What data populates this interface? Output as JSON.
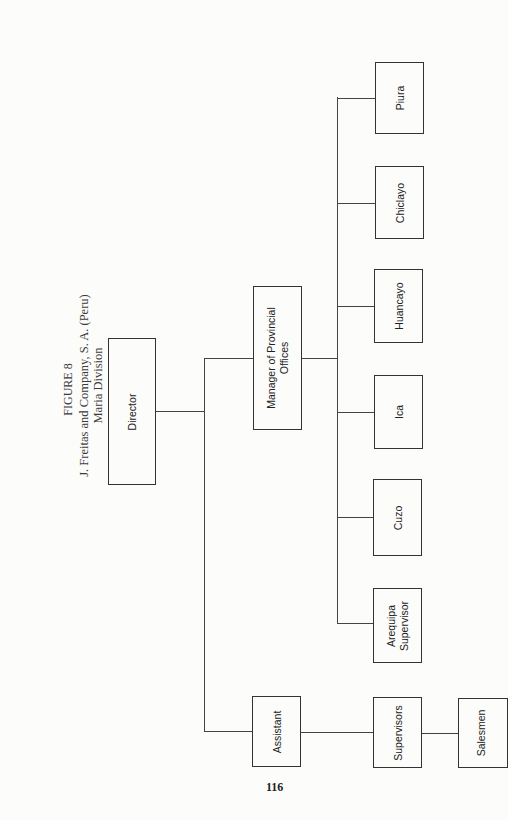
{
  "figure": {
    "label": "FIGURE 8",
    "title": "J. Freitas and Company, S. A. (Peru)",
    "subtitle": "Maria Division"
  },
  "org_chart": {
    "root": "Director",
    "nodes": {
      "director": "Director",
      "manager_provincial": "Manager of Provincial Offices",
      "manager_line1": "Manager of Provincial",
      "manager_line2": "Offices",
      "piura": "Piura",
      "chiclayo": "Chiclayo",
      "huancayo": "Huancayo",
      "ica": "Ica",
      "cuzo": "Cuzo",
      "arequipa_line1": "Arequipa",
      "arequipa_line2": "Supervisor",
      "assistant": "Assistant",
      "supervisors": "Supervisors",
      "salesmen": "Salesmen"
    },
    "hierarchy": [
      {
        "name": "Director",
        "children": [
          {
            "name": "Manager of Provincial Offices",
            "children": [
              {
                "name": "Piura"
              },
              {
                "name": "Chiclayo"
              },
              {
                "name": "Huancayo"
              },
              {
                "name": "Ica"
              },
              {
                "name": "Cuzo"
              },
              {
                "name": "Arequipa Supervisor"
              }
            ]
          },
          {
            "name": "Assistant",
            "children": [
              {
                "name": "Supervisors",
                "children": [
                  {
                    "name": "Salesmen"
                  }
                ]
              }
            ]
          }
        ]
      }
    ]
  },
  "page_number": "116"
}
